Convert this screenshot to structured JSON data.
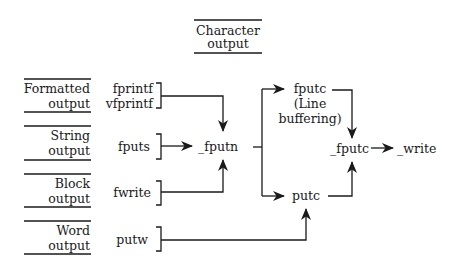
{
  "diagram": {
    "category_box": {
      "line1": "Character",
      "line2": "output"
    },
    "categories": [
      {
        "line1": "Formatted",
        "line2": "output"
      },
      {
        "line1": "String",
        "line2": "output"
      },
      {
        "line1": "Block",
        "line2": "output"
      },
      {
        "line1": "Word",
        "line2": "output"
      }
    ],
    "functions": {
      "fprintf": "fprintf",
      "vfprintf": "vfprintf",
      "fputs": "fputs",
      "fwrite": "fwrite",
      "putw": "putw"
    },
    "internal": {
      "fputn": "_fputn",
      "fputc": "fputc",
      "fputc_note_line1": "(Line",
      "fputc_note_line2": "buffering)",
      "putc": "putc",
      "_fputc": "_fputc",
      "write": "_write"
    },
    "arrow_style": "filled-arrowhead"
  }
}
